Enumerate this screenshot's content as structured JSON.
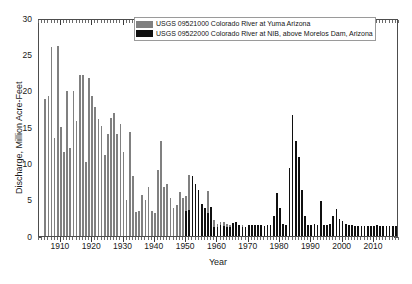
{
  "chart_data": {
    "type": "bar",
    "title": "",
    "xlabel": "Year",
    "ylabel": "Discharge, Million Acre-Feet",
    "xlim": [
      1903,
      2018
    ],
    "ylim": [
      0,
      30
    ],
    "ytick_values": [
      0,
      5,
      10,
      15,
      20,
      25,
      30
    ],
    "ytick_labels": [
      "0",
      "5",
      "10",
      "15",
      "20",
      "25",
      "30"
    ],
    "xtick_values": [
      1910,
      1920,
      1930,
      1940,
      1950,
      1960,
      1970,
      1980,
      1990,
      2000,
      2010
    ],
    "xtick_labels": [
      "1910",
      "1920",
      "1930",
      "1940",
      "1950",
      "1960",
      "1970",
      "1980",
      "1990",
      "2000",
      "2010"
    ],
    "grid": false,
    "legend_position": "top-center",
    "series": [
      {
        "name": "USGS 09521000 Colorado River at Yuma Arizona",
        "color": "#808080",
        "x": [
          1905,
          1906,
          1907,
          1908,
          1909,
          1910,
          1911,
          1912,
          1913,
          1914,
          1915,
          1916,
          1917,
          1918,
          1919,
          1920,
          1921,
          1922,
          1923,
          1924,
          1925,
          1926,
          1927,
          1928,
          1929,
          1930,
          1931,
          1932,
          1933,
          1934,
          1935,
          1936,
          1937,
          1938,
          1939,
          1940,
          1941,
          1942,
          1943,
          1944,
          1945,
          1946,
          1947,
          1948,
          1949,
          1950,
          1951,
          1952,
          1953,
          1954,
          1955,
          1956,
          1957,
          1958,
          1959,
          1960,
          1961,
          1962,
          1963,
          1964,
          1965,
          1966,
          1967,
          1968
        ],
        "values": [
          18.8,
          19.3,
          26.0,
          13.5,
          26.1,
          15.0,
          11.5,
          19.9,
          12.1,
          19.9,
          15.8,
          22.1,
          22.2,
          10.2,
          21.8,
          19.3,
          17.7,
          16.1,
          15.2,
          11.1,
          14.1,
          16.2,
          16.9,
          14.0,
          15.4,
          11.5,
          4.9,
          14.3,
          8.2,
          3.3,
          3.4,
          5.7,
          5.0,
          6.7,
          3.5,
          3.2,
          9.1,
          13.1,
          6.7,
          7.1,
          5.3,
          3.9,
          4.3,
          6.1,
          5.2,
          5.5,
          8.4,
          7.9,
          3.9,
          3.8,
          2.1,
          1.5,
          6.2,
          3.6,
          2.2,
          1.7,
          1.9,
          1.9,
          1.6,
          1.5,
          1.5,
          1.5,
          1.5,
          1.5
        ]
      },
      {
        "name": "USGS 09522000 Colorado River at NIB, above Morelos Dam, Arizona",
        "color": "#101010",
        "x": [
          1950,
          1951,
          1952,
          1953,
          1954,
          1955,
          1956,
          1957,
          1958,
          1959,
          1960,
          1961,
          1962,
          1963,
          1964,
          1965,
          1966,
          1967,
          1968,
          1969,
          1970,
          1971,
          1972,
          1973,
          1974,
          1975,
          1976,
          1977,
          1978,
          1979,
          1980,
          1981,
          1982,
          1983,
          1984,
          1985,
          1986,
          1987,
          1988,
          1989,
          1990,
          1991,
          1992,
          1993,
          1994,
          1995,
          1996,
          1997,
          1998,
          1999,
          2000,
          2001,
          2002,
          2003,
          2004,
          2005,
          2006,
          2007,
          2008,
          2009,
          2010,
          2011,
          2012,
          2013,
          2014,
          2015,
          2016,
          2017
        ],
        "values": [
          3.4,
          3.6,
          8.3,
          7.2,
          6.3,
          4.4,
          3.9,
          3.1,
          4.0,
          1.2,
          1.3,
          1.5,
          1.4,
          1.2,
          1.2,
          1.8,
          1.9,
          1.5,
          1.2,
          1.3,
          1.5,
          1.5,
          1.5,
          1.5,
          1.5,
          1.4,
          1.5,
          1.5,
          2.7,
          5.9,
          3.8,
          1.6,
          1.5,
          9.4,
          16.6,
          13.1,
          10.9,
          6.3,
          2.8,
          1.5,
          1.5,
          1.6,
          1.5,
          4.8,
          1.5,
          1.5,
          1.6,
          2.7,
          3.7,
          2.4,
          2.0,
          1.6,
          1.5,
          1.5,
          1.4,
          1.4,
          1.4,
          1.4,
          1.4,
          1.4,
          1.4,
          1.5,
          1.4,
          1.4,
          1.4,
          1.4,
          1.4,
          1.4
        ]
      }
    ]
  },
  "legend": {
    "items": [
      {
        "label": "USGS 09521000 Colorado River at Yuma Arizona",
        "color": "#808080"
      },
      {
        "label": "USGS 09522000 Colorado River at NIB, above Morelos Dam, Arizona",
        "color": "#101010"
      }
    ]
  },
  "axes": {
    "x_title": "Year",
    "y_title": "Discharge, Million Acre-Feet"
  }
}
